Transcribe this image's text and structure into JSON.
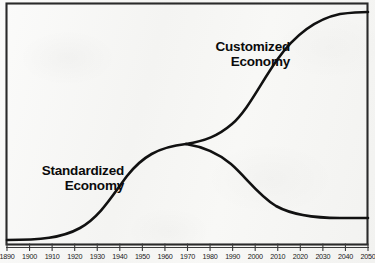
{
  "chart_data": {
    "type": "line",
    "title": "",
    "subtitle": "",
    "xlabel": "",
    "ylabel": "",
    "grid": false,
    "legend_position": "inline-annotations",
    "xlim": [
      1890,
      2050
    ],
    "ylim": [
      0,
      100
    ],
    "x_tick_labels": [
      "1890",
      "1900",
      "1910",
      "1920",
      "1930",
      "1940",
      "1950",
      "1960",
      "1970",
      "1980",
      "1990",
      "2000",
      "2010",
      "2020",
      "2030",
      "2040",
      "2050"
    ],
    "y_tick_labels": [],
    "annotations": [
      {
        "name": "customized-economy-label",
        "text_line1": "Customized",
        "text_line2": "Economy"
      },
      {
        "name": "standardized-economy-label",
        "text_line1": "Standardized",
        "text_line2": "Economy"
      }
    ],
    "series": [
      {
        "name": "Standardized Economy",
        "x": [
          1890,
          1900,
          1910,
          1920,
          1930,
          1940,
          1950,
          1960,
          1970,
          1980,
          1990,
          2000,
          2010,
          2020,
          2030,
          2040,
          2050
        ],
        "values": [
          2,
          2,
          3,
          5,
          9,
          18,
          33,
          50,
          60,
          62,
          58,
          48,
          35,
          22,
          13,
          8,
          6
        ]
      },
      {
        "name": "Customized Economy",
        "x": [
          1890,
          1900,
          1910,
          1920,
          1930,
          1940,
          1950,
          1960,
          1970,
          1980,
          1990,
          2000,
          2010,
          2020,
          2030,
          2040,
          2050
        ],
        "values": [
          2,
          2,
          3,
          5,
          9,
          18,
          33,
          50,
          60,
          63,
          70,
          80,
          88,
          93,
          96,
          97,
          97
        ]
      }
    ]
  },
  "style": {
    "curve_color": "#111111",
    "border_color": "#2a2a2a",
    "background_color": "#f7f7f5",
    "label_color": "#0b0b0b"
  }
}
